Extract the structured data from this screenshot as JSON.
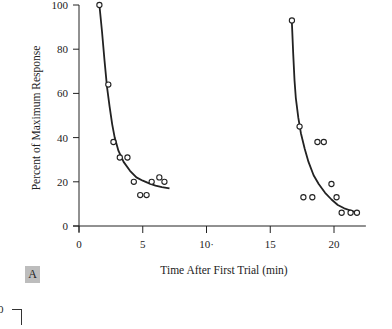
{
  "chart_data": {
    "type": "scatter",
    "title": "",
    "xlabel": "Time After First Trial (min)",
    "ylabel": "Percent of Maximum Response",
    "xlim": [
      0,
      22.5
    ],
    "ylim": [
      0,
      100
    ],
    "x_ticks": [
      0,
      5,
      10,
      15,
      20
    ],
    "x_tick_labels": [
      "0",
      "5",
      "10·",
      "15",
      "20"
    ],
    "y_ticks": [
      0,
      20,
      40,
      60,
      80,
      100
    ],
    "y_tick_labels": [
      "0",
      "20",
      "40",
      "60",
      "80",
      "100"
    ],
    "grid": false,
    "legend": null,
    "series": [
      {
        "name": "First trial block",
        "marker": "open-circle",
        "points": [
          [
            1.6,
            100
          ],
          [
            2.3,
            64
          ],
          [
            2.7,
            38
          ],
          [
            3.2,
            31
          ],
          [
            3.8,
            31
          ],
          [
            4.3,
            20
          ],
          [
            4.8,
            14
          ],
          [
            5.3,
            14
          ],
          [
            5.7,
            20
          ],
          [
            6.3,
            22
          ],
          [
            6.7,
            20
          ]
        ],
        "fit_curve": [
          [
            1.6,
            100
          ],
          [
            1.8,
            88
          ],
          [
            2.0,
            75
          ],
          [
            2.2,
            63
          ],
          [
            2.4,
            54
          ],
          [
            2.6,
            46
          ],
          [
            2.8,
            40
          ],
          [
            3.1,
            34
          ],
          [
            3.5,
            29
          ],
          [
            4.0,
            25
          ],
          [
            4.5,
            22
          ],
          [
            5.0,
            20.5
          ],
          [
            5.5,
            19.3
          ],
          [
            6.0,
            18.3
          ],
          [
            6.5,
            17.6
          ],
          [
            7.1,
            17
          ]
        ]
      },
      {
        "name": "Second trial block",
        "marker": "open-circle",
        "points": [
          [
            16.7,
            93
          ],
          [
            17.3,
            45
          ],
          [
            17.6,
            13
          ],
          [
            18.3,
            13
          ],
          [
            18.7,
            38
          ],
          [
            19.2,
            38
          ],
          [
            19.8,
            19
          ],
          [
            20.2,
            13
          ],
          [
            20.6,
            6
          ],
          [
            21.3,
            6
          ],
          [
            21.8,
            6
          ]
        ],
        "fit_curve": [
          [
            16.7,
            92
          ],
          [
            16.8,
            78
          ],
          [
            16.9,
            66
          ],
          [
            17.0,
            58
          ],
          [
            17.2,
            49
          ],
          [
            17.4,
            42
          ],
          [
            17.7,
            35
          ],
          [
            18.0,
            29
          ],
          [
            18.4,
            23
          ],
          [
            18.8,
            19
          ],
          [
            19.3,
            15
          ],
          [
            19.8,
            12
          ],
          [
            20.3,
            9.5
          ],
          [
            20.8,
            8
          ],
          [
            21.3,
            7
          ],
          [
            21.8,
            6
          ]
        ]
      }
    ]
  },
  "labels": {
    "panel": "A",
    "stray_tick": "0"
  },
  "colors": {
    "ink": "#222222",
    "panel_bg": "#bdbdbd",
    "background": "#ffffff"
  }
}
